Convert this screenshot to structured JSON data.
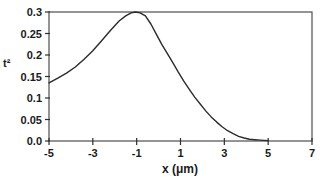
{
  "figure": {
    "background": "#ffffff",
    "text_color": "#1a1a1a",
    "frame_color": "#4d4d4d",
    "axis_color": "#2f2f2f"
  },
  "chart_data": {
    "type": "line",
    "title": "",
    "xlabel": "x (μm)",
    "ylabel": "t²",
    "xlim": [
      -5,
      7
    ],
    "ylim": [
      0,
      0.3
    ],
    "x_ticks": [
      -5,
      -3,
      -1,
      1,
      3,
      5,
      7
    ],
    "x_tick_labels": [
      "-5",
      "-3",
      "-1",
      "1",
      "3",
      "5",
      "7"
    ],
    "y_ticks": [
      0,
      0.05,
      0.1,
      0.15,
      0.2,
      0.25,
      0.3
    ],
    "y_tick_labels": [
      "0.0",
      "0.05",
      "0.1",
      "0.15",
      "0.2",
      "0.25",
      "0.3"
    ],
    "grid": false,
    "legend": null,
    "frame": "box",
    "line_color": "#2b2b2b",
    "series": [
      {
        "name": "t-squared profile",
        "x": [
          -5.0,
          -4.6,
          -4.2,
          -3.8,
          -3.4,
          -3.0,
          -2.6,
          -2.2,
          -1.8,
          -1.5,
          -1.25,
          -1.05,
          -0.85,
          -0.6,
          -0.35,
          -0.1,
          0.15,
          0.4,
          0.65,
          0.9,
          1.15,
          1.4,
          1.65,
          1.9,
          2.15,
          2.4,
          2.65,
          2.9,
          3.15,
          3.4,
          3.65,
          3.9,
          4.15,
          4.4,
          4.65,
          5.0
        ],
        "y": [
          0.135,
          0.146,
          0.158,
          0.172,
          0.19,
          0.21,
          0.233,
          0.257,
          0.279,
          0.291,
          0.298,
          0.3,
          0.298,
          0.291,
          0.272,
          0.248,
          0.224,
          0.203,
          0.182,
          0.16,
          0.139,
          0.12,
          0.102,
          0.086,
          0.07,
          0.056,
          0.044,
          0.033,
          0.024,
          0.017,
          0.011,
          0.007,
          0.004,
          0.003,
          0.002,
          0.001
        ]
      }
    ]
  }
}
